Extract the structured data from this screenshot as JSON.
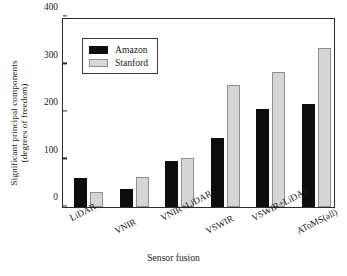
{
  "chart_data": {
    "type": "bar",
    "title": "",
    "xlabel": "Sensor fusion",
    "ylabel_line1": "Significant principal components",
    "ylabel_line2": "(degrees of freedom)",
    "categories": [
      "LiDAR",
      "VNIR",
      "VNIR+LiDAR",
      "VSWIR",
      "VSWIR+LiDAR",
      "AToMS(all)"
    ],
    "series": [
      {
        "name": "Amazon",
        "color": "#0d0d0d",
        "values": [
          62,
          37,
          97,
          145,
          207,
          217
        ]
      },
      {
        "name": "Stanford",
        "color": "#d6d6d6",
        "values": [
          32,
          64,
          104,
          257,
          284,
          334
        ]
      }
    ],
    "ylim": [
      0,
      400
    ],
    "yticks": [
      0,
      100,
      200,
      300,
      400
    ],
    "ytick_labels": [
      "0",
      "100",
      "200",
      "300",
      "400"
    ],
    "grid": false,
    "legend_position": "upper left",
    "xtick_rotation": -27
  }
}
